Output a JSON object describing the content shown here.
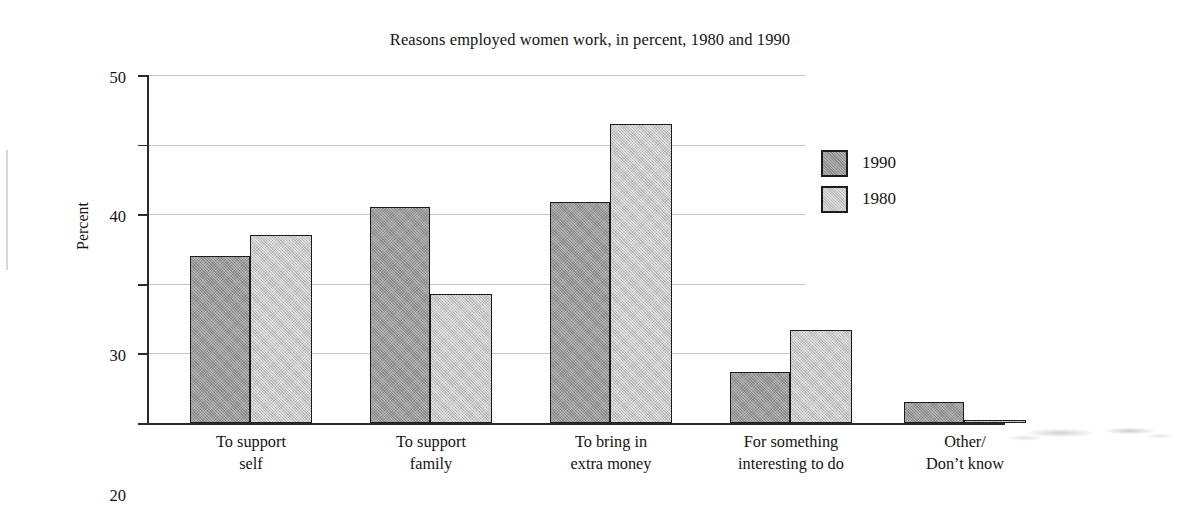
{
  "chart_data": {
    "type": "bar",
    "title": "Reasons employed women work, in percent, 1980 and 1990",
    "xlabel": "",
    "ylabel": "Percent",
    "ylim": [
      0,
      50
    ],
    "yticks": [
      0,
      10,
      20,
      30,
      40,
      50
    ],
    "ytick_labels": [
      "0",
      "10",
      "20",
      "30",
      "40",
      "50"
    ],
    "grid": true,
    "grid_axis": "y",
    "legend_position": "right",
    "categories": [
      "To support self",
      "To support family",
      "To bring in extra money",
      "For something interesting to do",
      "Other/ Don't know"
    ],
    "category_lines": [
      [
        "To support",
        "self"
      ],
      [
        "To support",
        "family"
      ],
      [
        "To bring in",
        "extra money"
      ],
      [
        "For something",
        "interesting to do"
      ],
      [
        "Other/",
        "Don’t know"
      ]
    ],
    "series": [
      {
        "name": "1990",
        "color": "#9b9b9b",
        "values": [
          24,
          31,
          31.8,
          7.3,
          3
        ]
      },
      {
        "name": "1980",
        "color": "#c8c8c8",
        "values": [
          27,
          18.5,
          43,
          13.3,
          0.5
        ]
      }
    ]
  },
  "legend": {
    "entries": [
      {
        "label": "1990",
        "swatch": "dark-gray-swatch"
      },
      {
        "label": "1980",
        "swatch": "light-gray-swatch"
      }
    ]
  },
  "colors": {
    "series_1990": "#9b9b9b",
    "series_1980": "#c8c8c8",
    "axis": "#2b2b2b",
    "gridline": "#c4c4c4",
    "text": "#131313",
    "background": "#ffffff"
  }
}
